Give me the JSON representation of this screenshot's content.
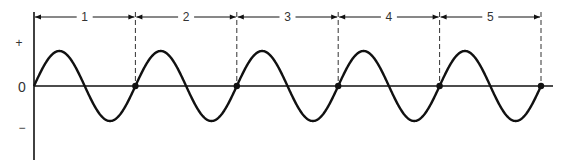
{
  "diagram": {
    "type": "sine-wave-cycles",
    "y_axis_labels": {
      "plus": "+",
      "zero": "0",
      "minus": "−"
    },
    "cycle_labels": [
      "1",
      "2",
      "3",
      "4",
      "5"
    ],
    "cycle_count": 5,
    "colors": {
      "line": "#111111",
      "dash": "#333333"
    }
  }
}
